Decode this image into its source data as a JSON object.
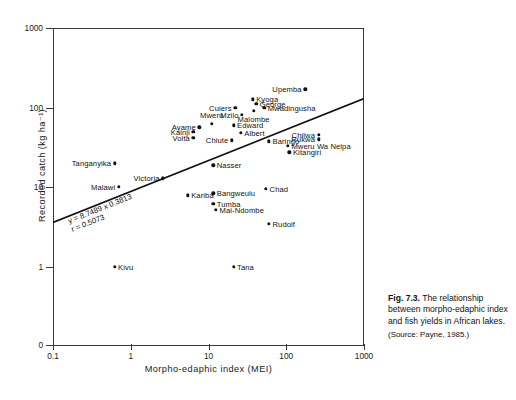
{
  "chart_data": {
    "type": "scatter",
    "title": "",
    "xlabel": "Morpho-edaphic index (MEI)",
    "ylabel": "Recorded catch (kg ha⁻¹)",
    "xscale": "log",
    "yscale": "log",
    "xlim": [
      0.1,
      1000
    ],
    "ylim": [
      1,
      1000
    ],
    "xticks": [
      "0.1",
      "1",
      "10",
      "100",
      "1000"
    ],
    "xtick_values": [
      0.1,
      1,
      10,
      100,
      1000
    ],
    "yticks": [
      "0",
      "1",
      "10",
      "100",
      "1000"
    ],
    "ytick_values": [
      0,
      1,
      10,
      100,
      1000
    ],
    "grid": false,
    "legend": false,
    "annotations": [
      {
        "name": "regression-equation",
        "text": "y = 8.7489 x 0.3813"
      },
      {
        "name": "correlation-coefficient",
        "text": "r = 0.5073"
      }
    ],
    "trendline": {
      "equation": "y = 8.7489 x 0.3813",
      "r": 0.5073,
      "intercept_a": 8.7489,
      "slope_b": 0.3813,
      "x_start": 0.1,
      "y_start": 3.63,
      "x_end": 1000,
      "y_end": 130.0
    },
    "points": [
      {
        "label": "Tanganyika",
        "x": 0.62,
        "y": 20.0,
        "side": "left"
      },
      {
        "label": "Victoria",
        "x": 2.6,
        "y": 13.0,
        "side": "left"
      },
      {
        "label": "Malawi",
        "x": 0.7,
        "y": 10.2,
        "side": "left"
      },
      {
        "label": "Kivu",
        "x": 0.62,
        "y": 1.0,
        "side": "right"
      },
      {
        "label": "Kariba",
        "x": 5.4,
        "y": 7.9,
        "side": "right"
      },
      {
        "label": "Bangweulu",
        "x": 11.5,
        "y": 8.4,
        "side": "right"
      },
      {
        "label": "Tumba",
        "x": 11.5,
        "y": 6.2,
        "side": "right"
      },
      {
        "label": "Mai-Ndombe",
        "x": 12.5,
        "y": 5.2,
        "side": "right"
      },
      {
        "label": "Tana",
        "x": 21.0,
        "y": 1.0,
        "side": "right"
      },
      {
        "label": "Rudolf",
        "x": 60.0,
        "y": 3.5,
        "side": "right"
      },
      {
        "label": "Chad",
        "x": 55.0,
        "y": 9.5,
        "side": "right"
      },
      {
        "label": "Nasser",
        "x": 11.5,
        "y": 19.0,
        "side": "right"
      },
      {
        "label": "Volta",
        "x": 6.4,
        "y": 42.0,
        "side": "left"
      },
      {
        "label": "Kainji",
        "x": 6.4,
        "y": 50.0,
        "side": "left"
      },
      {
        "label": "Ayame",
        "x": 7.6,
        "y": 57.0,
        "side": "left"
      },
      {
        "label": "Mweru",
        "x": 11.0,
        "y": 63.0,
        "side": "center-above"
      },
      {
        "label": "Chiute",
        "x": 20.0,
        "y": 39.0,
        "side": "left"
      },
      {
        "label": "Edward",
        "x": 21.0,
        "y": 60.0,
        "side": "right"
      },
      {
        "label": "Albert",
        "x": 26.0,
        "y": 48.0,
        "side": "right"
      },
      {
        "label": "Mzilo",
        "x": 27.0,
        "y": 82.0,
        "side": "left"
      },
      {
        "label": "Cuiers",
        "x": 22.0,
        "y": 100.0,
        "side": "left"
      },
      {
        "label": "Kyoga",
        "x": 37.0,
        "y": 128.0,
        "side": "right"
      },
      {
        "label": "George",
        "x": 41.0,
        "y": 112.0,
        "side": "right"
      },
      {
        "label": "Malombe",
        "x": 38.0,
        "y": 92.0,
        "side": "center-below"
      },
      {
        "label": "Mwadingusha",
        "x": 52.0,
        "y": 100.0,
        "side": "right"
      },
      {
        "label": "Upemba",
        "x": 175.0,
        "y": 170.0,
        "side": "left"
      },
      {
        "label": "Baringo",
        "x": 60.0,
        "y": 38.0,
        "side": "right"
      },
      {
        "label": "Chilwa",
        "x": 260.0,
        "y": 46.0,
        "side": "left"
      },
      {
        "label": "Rukwa",
        "x": 260.0,
        "y": 40.0,
        "side": "left"
      },
      {
        "label": "Mweru Wa Nelpa",
        "x": 105.0,
        "y": 33.0,
        "side": "right"
      },
      {
        "label": "Kitangiri",
        "x": 110.0,
        "y": 27.5,
        "side": "right"
      }
    ]
  },
  "caption": {
    "figure_number": "Fig. 7.3.",
    "text": "The relationship between morpho-edaphic index and fish yields in African lakes.",
    "source": "(Source: Payne, 1985.)"
  }
}
